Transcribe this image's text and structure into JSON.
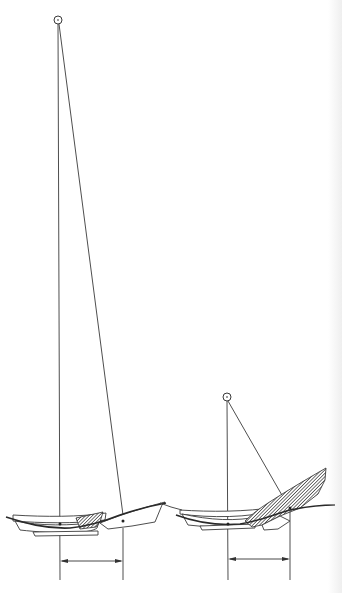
{
  "figure": {
    "type": "technical line drawing",
    "colors": {
      "line": "#3a3a3a",
      "hatch": "#2a2a2a",
      "background": "#ffffff"
    },
    "panels": [
      {
        "id": "left",
        "pivot": {
          "x": 58,
          "y": 20
        },
        "hull_marker": {
          "x": 123,
          "y": 520
        },
        "reference_marker": {
          "x": 60,
          "y": 524
        },
        "dimension_arrow": {
          "x1": 60,
          "x2": 123,
          "y": 561
        }
      },
      {
        "id": "right",
        "pivot": {
          "x": 227,
          "y": 397
        },
        "hull_marker": {
          "x": 290,
          "y": 508
        },
        "reference_marker": {
          "x": 228,
          "y": 524
        },
        "dimension_arrow": {
          "x1": 228,
          "x2": 290,
          "y": 559
        }
      }
    ]
  }
}
